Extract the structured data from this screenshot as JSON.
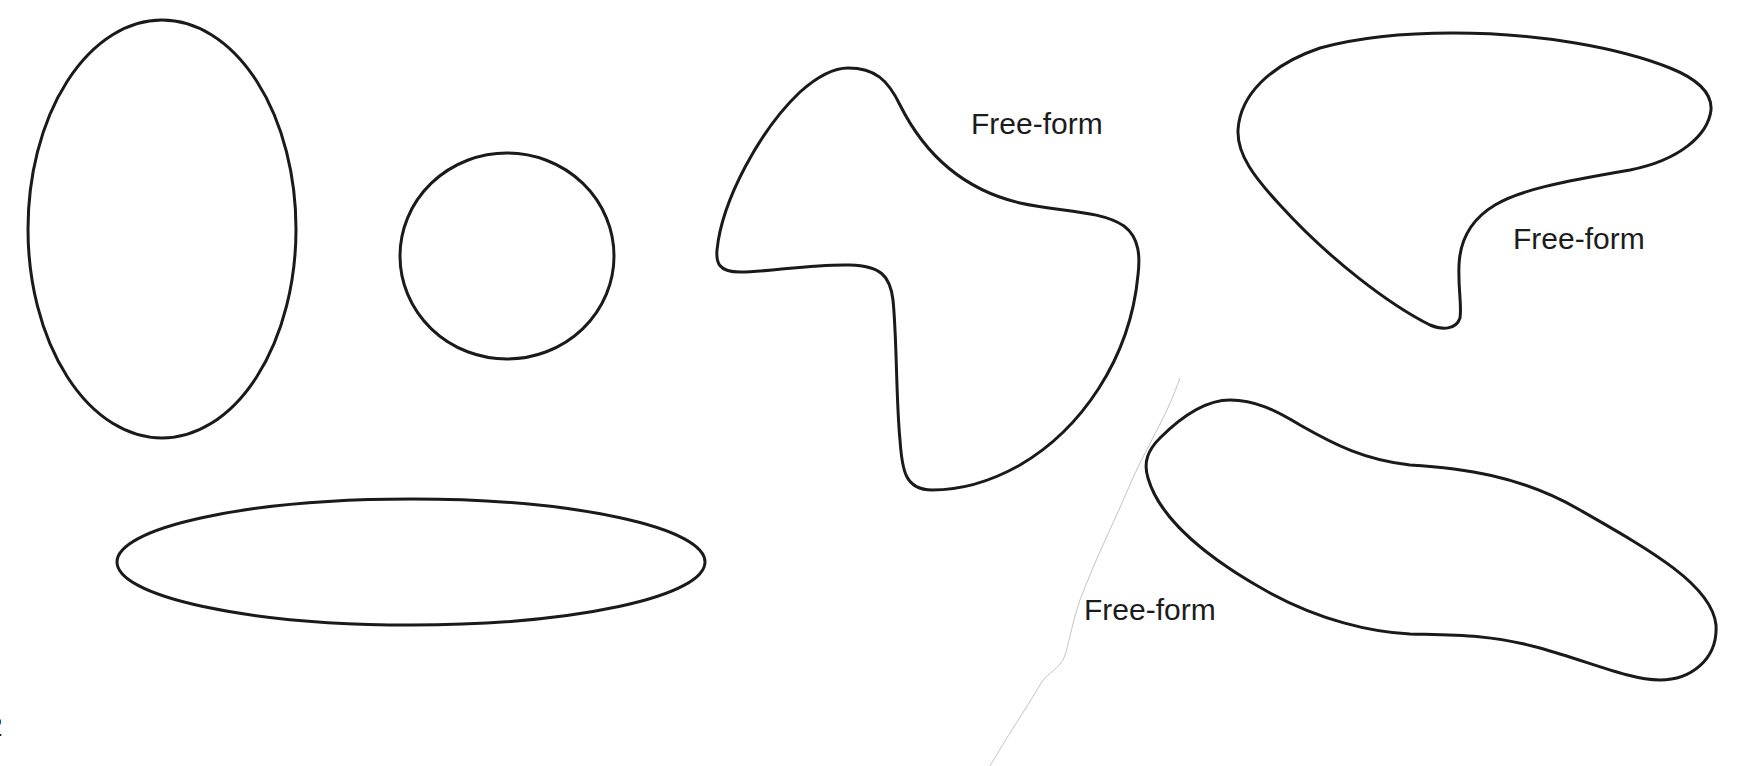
{
  "diagram": {
    "title": "",
    "background_color": "#ffffff",
    "stroke_color": "#1a1a1a",
    "shapes": [
      {
        "id": "tall-ellipse",
        "type": "ellipse",
        "label": ""
      },
      {
        "id": "circle",
        "type": "circle",
        "label": ""
      },
      {
        "id": "wide-ellipse",
        "type": "ellipse",
        "label": ""
      },
      {
        "id": "free-form-1",
        "type": "free-form",
        "label": "Free-form"
      },
      {
        "id": "free-form-2",
        "type": "free-form",
        "label": "Free-form"
      },
      {
        "id": "free-form-3",
        "type": "free-form",
        "label": "Free-form"
      }
    ],
    "labels": {
      "free_form_1": "Free-form",
      "free_form_2": "Free-form",
      "free_form_3": "Free-form"
    },
    "edge_fragment": "2"
  }
}
